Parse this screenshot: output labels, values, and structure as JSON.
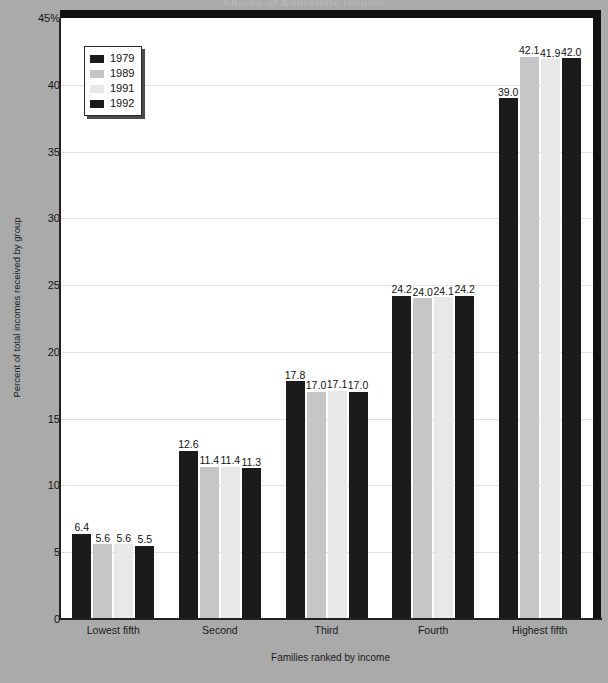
{
  "chart_data": {
    "type": "bar",
    "title": "Shares of Aggregate Income",
    "xlabel": "Families ranked by income",
    "ylabel": "Percent of total incomes received by group",
    "ylim": [
      0,
      45
    ],
    "yticks": [
      "0",
      "5",
      "10",
      "15",
      "20",
      "25",
      "30",
      "35",
      "40",
      "45%"
    ],
    "ytick_values": [
      0,
      5,
      10,
      15,
      20,
      25,
      30,
      35,
      40,
      45
    ],
    "grid": true,
    "legend_position": "upper-left",
    "categories": [
      "Lowest fifth",
      "Second",
      "Third",
      "Fourth",
      "Highest fifth"
    ],
    "series": [
      {
        "name": "1979",
        "color": "#1b1b1b",
        "values": [
          6.4,
          12.6,
          17.8,
          24.2,
          39.0
        ],
        "labels": [
          "6.4",
          "12.6",
          "17.8",
          "24.2",
          "39.0"
        ]
      },
      {
        "name": "1989",
        "color": "#c6c6c6",
        "values": [
          5.6,
          11.4,
          17.0,
          24.0,
          42.1
        ],
        "labels": [
          "5.6",
          "11.4",
          "17.0",
          "24.0",
          "42.1"
        ]
      },
      {
        "name": "1991",
        "color": "#e8e8e8",
        "values": [
          5.6,
          11.4,
          17.1,
          24.1,
          41.9
        ],
        "labels": [
          "5.6",
          "11.4",
          "17.1",
          "24.1",
          "41.9"
        ]
      },
      {
        "name": "1992",
        "color": "#1b1b1b",
        "values": [
          5.5,
          11.3,
          17.0,
          24.2,
          42.0
        ],
        "labels": [
          "5.5",
          "11.3",
          "17.0",
          "24.2",
          "42.0"
        ]
      }
    ]
  },
  "colors": {
    "background": "#aaaaaa",
    "plot_background": "#ffffff",
    "frame": "#111111",
    "gridline": "#e2e2e2",
    "text": "#111111"
  }
}
